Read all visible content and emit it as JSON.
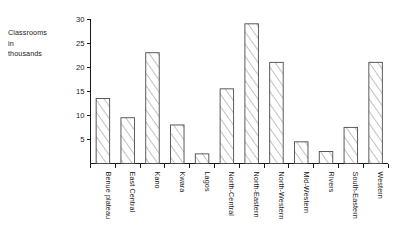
{
  "chart_data": {
    "type": "bar",
    "title": "",
    "subtitle": "",
    "xlabel": "",
    "ylabel": "Classrooms in thousands",
    "ylabel_lines": [
      "Classrooms",
      "in",
      "thousands"
    ],
    "ylim": [
      0,
      30
    ],
    "ytick_values": [
      5,
      10,
      15,
      20,
      25,
      30
    ],
    "ytick_labels": [
      "5",
      "10",
      "15",
      "20",
      "25",
      "30"
    ],
    "grid": false,
    "legend": false,
    "bar_style": {
      "fill": "diagonal-hatch",
      "fill_color": "#ffffff",
      "edge_color": "#4a4a4a",
      "hatch_color": "#6e6e6e"
    },
    "categories": [
      "Benue plateau",
      "East Central",
      "Kano",
      "Kwara",
      "Lagos",
      "North-Central",
      "North-Eastern",
      "North-Western",
      "Mid-Western",
      "Rivers",
      "South-Eastern",
      "Western"
    ],
    "values": [
      13.5,
      9.5,
      23.0,
      8.0,
      2.0,
      15.5,
      29.0,
      21.0,
      4.5,
      2.5,
      7.5,
      21.0
    ]
  }
}
